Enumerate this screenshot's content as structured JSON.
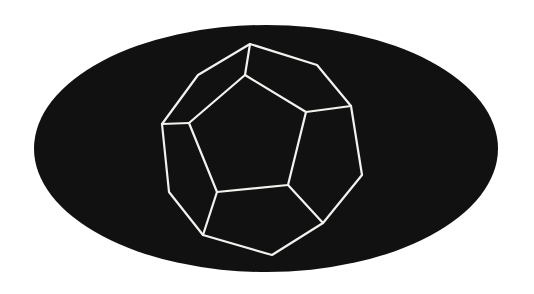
{
  "canvas": {
    "width": 534,
    "height": 294,
    "background": "#ffffff"
  },
  "backdrop": {
    "shape": "ellipse",
    "cx": 266,
    "cy": 148.5,
    "rx": 232,
    "ry": 123.5,
    "fill": "#111111"
  },
  "figure": {
    "name": "dodecahedron-wireframe",
    "stroke": "#f2f2ee",
    "stroke_width": 2.2,
    "outer_decagon": [
      [
        250,
        44
      ],
      [
        317,
        65
      ],
      [
        351,
        106
      ],
      [
        362,
        175
      ],
      [
        323,
        223
      ],
      [
        272,
        255
      ],
      [
        203,
        235
      ],
      [
        169,
        192
      ],
      [
        162,
        124
      ],
      [
        198,
        75
      ]
    ],
    "inner_pentagon": [
      [
        245,
        75
      ],
      [
        306,
        112
      ],
      [
        288,
        185
      ],
      [
        217,
        192
      ],
      [
        189,
        123
      ]
    ],
    "spokes": [
      [
        [
          245,
          75
        ],
        [
          250,
          44
        ]
      ],
      [
        [
          306,
          112
        ],
        [
          351,
          106
        ]
      ],
      [
        [
          288,
          185
        ],
        [
          323,
          223
        ]
      ],
      [
        [
          217,
          192
        ],
        [
          203,
          235
        ]
      ],
      [
        [
          189,
          123
        ],
        [
          162,
          124
        ]
      ]
    ]
  }
}
